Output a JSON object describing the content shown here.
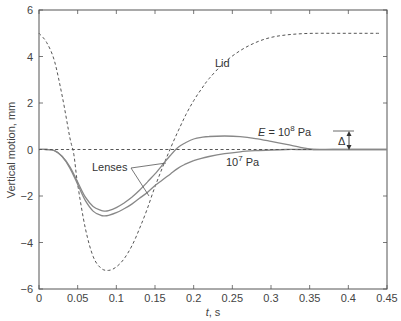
{
  "chart_data": {
    "type": "line",
    "title": "",
    "xlabel": "t, s",
    "ylabel": "Vertical motion, mm",
    "xlim": [
      0,
      0.45
    ],
    "ylim": [
      -6,
      6
    ],
    "grid": false,
    "xticks": [
      "0",
      "0.05",
      "0.1",
      "0.15",
      "0.2",
      "0.25",
      "0.3",
      "0.35",
      "0.4",
      "0.45"
    ],
    "yticks": [
      "6",
      "4",
      "2",
      "0",
      "−2",
      "−4",
      "−6"
    ],
    "series": [
      {
        "name": "Lid",
        "style": "dashed",
        "x": [
          0,
          0.01,
          0.02,
          0.03,
          0.04,
          0.045,
          0.05,
          0.06,
          0.07,
          0.08,
          0.09,
          0.1,
          0.11,
          0.12,
          0.13,
          0.14,
          0.15,
          0.16,
          0.17,
          0.18,
          0.19,
          0.2,
          0.21,
          0.22,
          0.24,
          0.26,
          0.28,
          0.3,
          0.32,
          0.34,
          0.36,
          0.38,
          0.4,
          0.42,
          0.44
        ],
        "y": [
          5.0,
          4.6,
          3.8,
          2.3,
          0.5,
          -0.2,
          -1.5,
          -3.4,
          -4.6,
          -5.1,
          -5.2,
          -5.05,
          -4.7,
          -4.15,
          -3.4,
          -2.55,
          -1.6,
          -0.75,
          0.05,
          0.8,
          1.5,
          2.1,
          2.6,
          3.05,
          3.75,
          4.25,
          4.6,
          4.82,
          4.93,
          4.98,
          5.0,
          5.0,
          5.0,
          5.0,
          5.0
        ]
      },
      {
        "name": "Lens E = 10^8 Pa",
        "style": "solid",
        "x": [
          0,
          0.01,
          0.02,
          0.03,
          0.04,
          0.05,
          0.06,
          0.07,
          0.08,
          0.085,
          0.09,
          0.1,
          0.11,
          0.12,
          0.13,
          0.14,
          0.15,
          0.16,
          0.17,
          0.18,
          0.19,
          0.2,
          0.21,
          0.22,
          0.24,
          0.26,
          0.28,
          0.3,
          0.32,
          0.34,
          0.355,
          0.38,
          0.41,
          0.45
        ],
        "y": [
          0,
          0,
          -0.05,
          -0.3,
          -0.75,
          -1.4,
          -2.05,
          -2.45,
          -2.62,
          -2.65,
          -2.63,
          -2.5,
          -2.3,
          -2.05,
          -1.75,
          -1.4,
          -1.05,
          -0.65,
          -0.25,
          0.1,
          0.3,
          0.45,
          0.52,
          0.56,
          0.58,
          0.55,
          0.47,
          0.35,
          0.22,
          0.08,
          0,
          0,
          0,
          0
        ]
      },
      {
        "name": "Lens E = 10^7 Pa",
        "style": "solid",
        "x": [
          0,
          0.01,
          0.02,
          0.03,
          0.04,
          0.05,
          0.06,
          0.07,
          0.08,
          0.085,
          0.09,
          0.1,
          0.11,
          0.12,
          0.13,
          0.14,
          0.15,
          0.16,
          0.17,
          0.18,
          0.19,
          0.2,
          0.21,
          0.22,
          0.24,
          0.26,
          0.28,
          0.3,
          0.32,
          0.34,
          0.36,
          0.38,
          0.41,
          0.45
        ],
        "y": [
          0,
          0,
          -0.05,
          -0.3,
          -0.8,
          -1.5,
          -2.2,
          -2.65,
          -2.83,
          -2.85,
          -2.83,
          -2.72,
          -2.55,
          -2.35,
          -2.1,
          -1.85,
          -1.55,
          -1.3,
          -1.05,
          -0.8,
          -0.62,
          -0.48,
          -0.38,
          -0.3,
          -0.18,
          -0.1,
          -0.05,
          -0.02,
          0,
          0,
          0,
          0,
          0,
          0
        ]
      },
      {
        "name": "Zero reference",
        "style": "dashed",
        "x": [
          0,
          0.355
        ],
        "y": [
          0,
          0
        ]
      }
    ],
    "annotations": [
      {
        "text": "Lid",
        "x": 0.2,
        "y": 3.2
      },
      {
        "text": "E = 10^8 Pa",
        "x": 0.21,
        "y": 0.9
      },
      {
        "text": "10^7 Pa",
        "x": 0.235,
        "y": -0.75
      },
      {
        "text": "Lenses",
        "x": 0.085,
        "y": -1.0
      },
      {
        "text": "Δ",
        "x": 0.39,
        "y": 0.3
      }
    ]
  },
  "labels": {
    "ylabel": "Vertical motion, mm",
    "xlabel_var": "t",
    "xlabel_unit": ", s",
    "lid": "Lid",
    "e_prefix": "E",
    "e_eq": " = 10",
    "e_exp": "8",
    "e_unit": " Pa",
    "e7_base": "10",
    "e7_exp": "7",
    "e7_unit": " Pa",
    "lenses": "Lenses",
    "delta": "Δ"
  }
}
